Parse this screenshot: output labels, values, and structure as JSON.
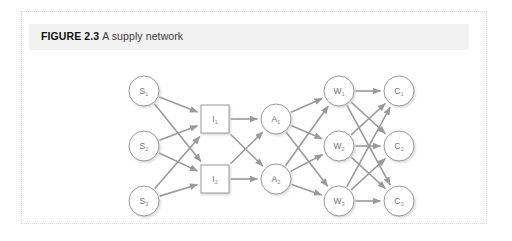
{
  "figure": {
    "label": "FIGURE 2.3",
    "title": "A supply network",
    "caption_full": "FIGURE 2.3 A supply network",
    "band_color": "#f2f2f2",
    "panel_border_color": "#d9d9d9",
    "panel_background": "#ffffff"
  },
  "diagram": {
    "type": "network",
    "node_stroke_color": "#8e8e8e",
    "node_fill_color": "#ffffff",
    "edge_color": "#9a9a9a",
    "label_color": "#6f6f6f",
    "layers": [
      {
        "id": "suppliers",
        "name": "Suppliers",
        "shape": "circle",
        "nodes": [
          {
            "id": "S1",
            "base": "S",
            "sub": "1",
            "cx": 122,
            "cy": 79
          },
          {
            "id": "S2",
            "base": "S",
            "sub": "2",
            "cx": 122,
            "cy": 134
          },
          {
            "id": "S3",
            "base": "S",
            "sub": "3",
            "cx": 122,
            "cy": 189
          }
        ]
      },
      {
        "id": "intermediates",
        "name": "Intermediates",
        "shape": "square",
        "nodes": [
          {
            "id": "I1",
            "base": "I",
            "sub": "1",
            "cx": 193,
            "cy": 107
          },
          {
            "id": "I2",
            "base": "I",
            "sub": "2",
            "cx": 193,
            "cy": 167
          }
        ]
      },
      {
        "id": "assemblers",
        "name": "Assemblers",
        "shape": "circle",
        "nodes": [
          {
            "id": "A1",
            "base": "A",
            "sub": "1",
            "cx": 254,
            "cy": 107
          },
          {
            "id": "A2",
            "base": "A",
            "sub": "2",
            "cx": 254,
            "cy": 167
          }
        ]
      },
      {
        "id": "warehouses",
        "name": "Warehouses",
        "shape": "circle",
        "nodes": [
          {
            "id": "W1",
            "base": "W",
            "sub": "1",
            "cx": 317,
            "cy": 79
          },
          {
            "id": "W2",
            "base": "W",
            "sub": "2",
            "cx": 317,
            "cy": 134
          },
          {
            "id": "W3",
            "base": "W",
            "sub": "3",
            "cx": 317,
            "cy": 189
          }
        ]
      },
      {
        "id": "customers",
        "name": "Customers",
        "shape": "circle",
        "nodes": [
          {
            "id": "C1",
            "base": "C",
            "sub": "1",
            "cx": 377,
            "cy": 79
          },
          {
            "id": "C2",
            "base": "C",
            "sub": "2",
            "cx": 377,
            "cy": 134
          },
          {
            "id": "C3",
            "base": "C",
            "sub": "3",
            "cx": 377,
            "cy": 189
          }
        ]
      }
    ],
    "edges": [
      {
        "from": "S1",
        "to": "I1"
      },
      {
        "from": "S1",
        "to": "I2"
      },
      {
        "from": "S2",
        "to": "I1"
      },
      {
        "from": "S2",
        "to": "I2"
      },
      {
        "from": "S3",
        "to": "I1"
      },
      {
        "from": "S3",
        "to": "I2"
      },
      {
        "from": "I1",
        "to": "A1"
      },
      {
        "from": "I1",
        "to": "A2"
      },
      {
        "from": "I2",
        "to": "A1"
      },
      {
        "from": "I2",
        "to": "A2"
      },
      {
        "from": "A1",
        "to": "W1"
      },
      {
        "from": "A1",
        "to": "W2"
      },
      {
        "from": "A1",
        "to": "W3"
      },
      {
        "from": "A2",
        "to": "W1"
      },
      {
        "from": "A2",
        "to": "W2"
      },
      {
        "from": "A2",
        "to": "W3"
      },
      {
        "from": "W1",
        "to": "C1"
      },
      {
        "from": "W1",
        "to": "C2"
      },
      {
        "from": "W1",
        "to": "C3"
      },
      {
        "from": "W2",
        "to": "C1"
      },
      {
        "from": "W2",
        "to": "C2"
      },
      {
        "from": "W2",
        "to": "C3"
      },
      {
        "from": "W3",
        "to": "C1"
      },
      {
        "from": "W3",
        "to": "C2"
      },
      {
        "from": "W3",
        "to": "C3"
      }
    ],
    "geometry": {
      "circle_radius": 15,
      "square_half": 14
    }
  }
}
